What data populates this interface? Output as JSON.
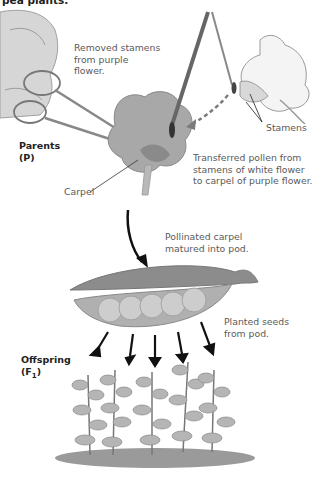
{
  "figure": {
    "title_partial": "pea plants.",
    "captions": {
      "removed": [
        "Removed stamens",
        "from purple",
        "flower."
      ],
      "stamens": "Stamens",
      "transferred": [
        "Transferred pollen from",
        "stamens of white flower",
        "to carpel of purple flower."
      ],
      "carpel": "Carpel",
      "pollinated": [
        "Pollinated carpel",
        "matured into pod."
      ],
      "planted": [
        "Planted seeds",
        "from pod."
      ]
    },
    "generations": {
      "parents": {
        "label": "Parents",
        "symbol": "(P)"
      },
      "offspring": {
        "label": "Offspring",
        "symbol_prefix": "(F",
        "symbol_sub": "1",
        "symbol_suffix": ")"
      }
    },
    "colors": {
      "flower_purple_gray": "#9a9a9a",
      "pod_gray": "#8f8f8f",
      "seed_gray": "#c8c8c8",
      "plant_gray": "#a5a5a5",
      "arrow_black": "#111111",
      "dashed_arrow": "#777777"
    },
    "pod_seed_count": 5,
    "plant_count": 5
  }
}
